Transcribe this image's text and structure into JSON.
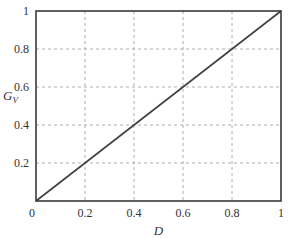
{
  "chart_data": {
    "type": "line",
    "title": "",
    "xlabel": "D",
    "ylabel": "G_V",
    "ylabel_main": "G",
    "ylabel_sub": "V",
    "xlim": [
      0,
      1
    ],
    "ylim": [
      0,
      1
    ],
    "grid": true,
    "grid_style": "dashed",
    "legend": null,
    "x_ticks": [
      "0",
      "0.2",
      "0.4",
      "0.6",
      "0.8",
      "1"
    ],
    "y_ticks": [
      "0",
      "0.2",
      "0.4",
      "0.6",
      "0.8",
      "1"
    ],
    "series": [
      {
        "name": "G_V vs D",
        "x": [
          0,
          0.2,
          0.4,
          0.6,
          0.8,
          1
        ],
        "y": [
          0,
          0.2,
          0.4,
          0.6,
          0.8,
          1
        ],
        "color": "#404040"
      }
    ]
  }
}
